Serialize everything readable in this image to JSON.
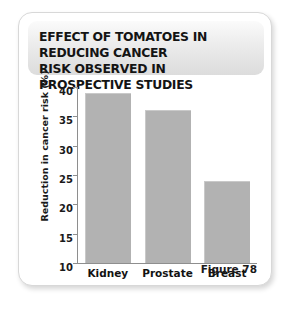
{
  "figure": {
    "title": "EFFECT OF TOMATOES IN REDUCING CANCER RISK OBSERVED IN PROSPECTIVE STUDIES",
    "title_line_1": "EFFECT OF TOMATOES IN REDUCING CANCER",
    "title_line_2": "RISK OBSERVED IN PROSPECTIVE STUDIES",
    "caption": "Figure 78"
  },
  "colors": {
    "bar_fill": "#b2b2b2",
    "axis": "#8e8e8e",
    "text": "#141414",
    "card_background": "#ffffff",
    "title_plate": "#e4e4e4",
    "page_background": "#ffffff"
  },
  "chart_data": {
    "type": "bar",
    "title": "EFFECT OF TOMATOES IN REDUCING CANCER RISK OBSERVED IN PROSPECTIVE STUDIES",
    "categories": [
      "Kidney",
      "Prostate",
      "Breast"
    ],
    "values": [
      39,
      36,
      24
    ],
    "xlabel": "",
    "ylabel": "Reduction in cancer risk (%)",
    "ylim": [
      10,
      40
    ],
    "yticks": [
      10,
      15,
      20,
      25,
      30,
      35,
      40
    ],
    "ytick_labels": [
      "10",
      "15",
      "20",
      "25",
      "30",
      "35",
      "40"
    ],
    "grid": false,
    "legend": false,
    "annotations": [
      "Figure 78"
    ]
  }
}
